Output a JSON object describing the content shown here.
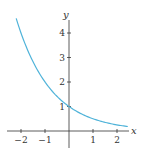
{
  "chart_data": {
    "type": "line",
    "title": "",
    "xlabel": "x",
    "ylabel": "y",
    "function": "y = (1/2)^x",
    "xlim": [
      -2.5,
      2.6
    ],
    "ylim": [
      0,
      4.6
    ],
    "x_ticks": [
      -2,
      -1,
      1,
      2
    ],
    "y_ticks": [
      1,
      2,
      3,
      4
    ],
    "x_tick_labels": [
      "−2",
      "−1",
      "1",
      "2"
    ],
    "y_tick_labels": [
      "1",
      "2",
      "3",
      "4"
    ],
    "grid": false,
    "legend": null,
    "series": [
      {
        "name": "curve",
        "color": "#4fb3d9",
        "x": [
          -2.2,
          -2,
          -1.5,
          -1,
          -0.5,
          0,
          0.5,
          1,
          1.5,
          2,
          2.45
        ],
        "y": [
          4.59,
          4.0,
          2.83,
          2.0,
          1.41,
          1.0,
          0.71,
          0.5,
          0.35,
          0.25,
          0.18
        ]
      }
    ]
  }
}
